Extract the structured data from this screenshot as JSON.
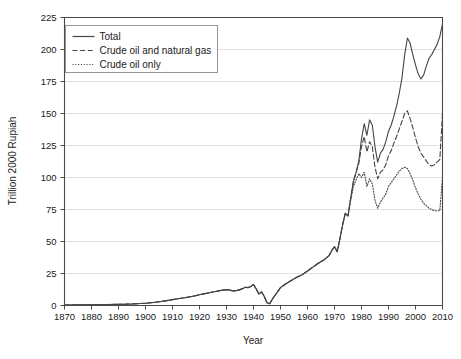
{
  "chart_data": {
    "type": "line",
    "title": "",
    "xlabel": "Year",
    "ylabel": "Trillion 2000 Rupiah",
    "xlim": [
      1870,
      2010
    ],
    "ylim": [
      0,
      225
    ],
    "xticks": [
      1870,
      1880,
      1890,
      1900,
      1910,
      1920,
      1930,
      1940,
      1950,
      1960,
      1970,
      1980,
      1990,
      2000,
      2010
    ],
    "yticks": [
      0,
      25,
      50,
      75,
      100,
      125,
      150,
      175,
      200,
      225
    ],
    "grid": "horizontal",
    "legend_position": "top-left",
    "series": [
      {
        "name": "Total",
        "style": "solid",
        "color": "#444444",
        "x": [
          1870,
          1875,
          1880,
          1885,
          1890,
          1895,
          1900,
          1903,
          1906,
          1909,
          1912,
          1915,
          1918,
          1920,
          1922,
          1924,
          1926,
          1928,
          1930,
          1931,
          1932,
          1933,
          1934,
          1935,
          1936,
          1937,
          1938,
          1939,
          1940,
          1941,
          1942,
          1943,
          1944,
          1945,
          1946,
          1947,
          1948,
          1949,
          1950,
          1952,
          1954,
          1956,
          1958,
          1960,
          1962,
          1964,
          1966,
          1968,
          1969,
          1970,
          1971,
          1972,
          1973,
          1974,
          1975,
          1976,
          1977,
          1978,
          1979,
          1980,
          1981,
          1982,
          1983,
          1984,
          1985,
          1986,
          1987,
          1988,
          1989,
          1990,
          1991,
          1992,
          1993,
          1994,
          1995,
          1996,
          1997,
          1998,
          1999,
          2000,
          2001,
          2002,
          2003,
          2004,
          2005,
          2006,
          2007,
          2008,
          2009,
          2010
        ],
        "y": [
          0.4,
          0.5,
          0.6,
          0.7,
          0.9,
          1.2,
          1.8,
          2.4,
          3.2,
          4.2,
          5.3,
          6.2,
          7.4,
          8.4,
          9.3,
          10.2,
          11.0,
          11.8,
          12.4,
          12.2,
          11.6,
          11.4,
          11.8,
          12.4,
          13.2,
          14.2,
          14.0,
          14.8,
          16.4,
          13.0,
          9.0,
          10.6,
          7.0,
          2.2,
          1.4,
          5.0,
          8.0,
          11.0,
          14.0,
          17.0,
          19.5,
          22.0,
          24.0,
          27.0,
          30.0,
          33.0,
          35.5,
          39.0,
          43.0,
          46.0,
          42.0,
          52.0,
          63.0,
          72.0,
          70.0,
          84.0,
          97.0,
          104.0,
          113.0,
          130.0,
          142.0,
          133.0,
          145.0,
          141.0,
          124.0,
          112.0,
          119.0,
          122.0,
          128.0,
          136.0,
          141.0,
          148.0,
          156.0,
          166.0,
          178.0,
          196.0,
          209.0,
          205.0,
          196.0,
          188.0,
          181.0,
          177.0,
          180.0,
          187.0,
          193.0,
          196.0,
          200.0,
          204.0,
          210.0,
          220.0
        ]
      },
      {
        "name": "Crude oil and natural gas",
        "style": "dashed",
        "color": "#444444",
        "x": [
          1870,
          1875,
          1880,
          1885,
          1890,
          1895,
          1900,
          1903,
          1906,
          1909,
          1912,
          1915,
          1918,
          1920,
          1922,
          1924,
          1926,
          1928,
          1930,
          1931,
          1932,
          1933,
          1934,
          1935,
          1936,
          1937,
          1938,
          1939,
          1940,
          1941,
          1942,
          1943,
          1944,
          1945,
          1946,
          1947,
          1948,
          1949,
          1950,
          1952,
          1954,
          1956,
          1958,
          1960,
          1962,
          1964,
          1966,
          1968,
          1969,
          1970,
          1971,
          1972,
          1973,
          1974,
          1975,
          1976,
          1977,
          1978,
          1979,
          1980,
          1981,
          1982,
          1983,
          1984,
          1985,
          1986,
          1987,
          1988,
          1989,
          1990,
          1991,
          1992,
          1993,
          1994,
          1995,
          1996,
          1997,
          1998,
          1999,
          2000,
          2001,
          2002,
          2003,
          2004,
          2005,
          2006,
          2007,
          2008,
          2009,
          2010
        ],
        "y": [
          0.4,
          0.5,
          0.6,
          0.7,
          0.9,
          1.2,
          1.8,
          2.4,
          3.2,
          4.2,
          5.3,
          6.2,
          7.4,
          8.4,
          9.3,
          10.2,
          11.0,
          11.8,
          12.4,
          12.2,
          11.6,
          11.4,
          11.8,
          12.4,
          13.2,
          14.2,
          14.0,
          14.8,
          16.4,
          13.0,
          9.0,
          10.6,
          7.0,
          2.2,
          1.4,
          5.0,
          8.0,
          11.0,
          14.0,
          17.0,
          19.5,
          22.0,
          24.0,
          27.0,
          30.0,
          33.0,
          35.5,
          39.0,
          43.0,
          46.0,
          42.0,
          52.0,
          63.0,
          72.0,
          70.0,
          84.0,
          97.0,
          104.0,
          111.0,
          124.0,
          132.0,
          120.0,
          128.0,
          124.0,
          108.0,
          99.0,
          104.0,
          106.0,
          110.0,
          117.0,
          121.0,
          127.0,
          132.0,
          138.0,
          144.0,
          150.0,
          152.0,
          146.0,
          139.0,
          131.0,
          124.0,
          119.0,
          116.0,
          113.0,
          110.0,
          109.0,
          110.0,
          112.0,
          114.0,
          150.0
        ]
      },
      {
        "name": "Crude oil only",
        "style": "dotted",
        "color": "#444444",
        "x": [
          1870,
          1875,
          1880,
          1885,
          1890,
          1895,
          1900,
          1903,
          1906,
          1909,
          1912,
          1915,
          1918,
          1920,
          1922,
          1924,
          1926,
          1928,
          1930,
          1931,
          1932,
          1933,
          1934,
          1935,
          1936,
          1937,
          1938,
          1939,
          1940,
          1941,
          1942,
          1943,
          1944,
          1945,
          1946,
          1947,
          1948,
          1949,
          1950,
          1952,
          1954,
          1956,
          1958,
          1960,
          1962,
          1964,
          1966,
          1968,
          1969,
          1970,
          1971,
          1972,
          1973,
          1974,
          1975,
          1976,
          1977,
          1978,
          1979,
          1980,
          1981,
          1982,
          1983,
          1984,
          1985,
          1986,
          1987,
          1988,
          1989,
          1990,
          1991,
          1992,
          1993,
          1994,
          1995,
          1996,
          1997,
          1998,
          1999,
          2000,
          2001,
          2002,
          2003,
          2004,
          2005,
          2006,
          2007,
          2008,
          2009,
          2010
        ],
        "y": [
          0.4,
          0.5,
          0.6,
          0.7,
          0.9,
          1.2,
          1.8,
          2.4,
          3.2,
          4.2,
          5.3,
          6.2,
          7.4,
          8.4,
          9.3,
          10.2,
          11.0,
          11.8,
          12.4,
          12.2,
          11.6,
          11.4,
          11.8,
          12.4,
          13.2,
          14.2,
          14.0,
          14.8,
          16.4,
          13.0,
          9.0,
          10.6,
          7.0,
          2.2,
          1.4,
          5.0,
          8.0,
          11.0,
          14.0,
          17.0,
          19.5,
          22.0,
          24.0,
          27.0,
          30.0,
          33.0,
          35.5,
          39.0,
          43.0,
          46.0,
          42.0,
          52.0,
          63.0,
          72.0,
          70.0,
          82.0,
          93.0,
          98.0,
          103.0,
          100.0,
          104.0,
          93.0,
          99.0,
          95.0,
          82.0,
          76.0,
          81.0,
          84.0,
          87.0,
          93.0,
          96.0,
          99.0,
          102.0,
          105.0,
          107.0,
          108.0,
          107.0,
          103.0,
          98.0,
          92.0,
          87.0,
          83.0,
          80.0,
          78.0,
          76.0,
          75.0,
          74.0,
          74.0,
          74.0,
          100.0
        ]
      }
    ]
  },
  "legend": {
    "entries": [
      {
        "label": "Total",
        "style": "solid"
      },
      {
        "label": "Crude oil and natural gas",
        "style": "dashed"
      },
      {
        "label": "Crude oil only",
        "style": "dotted"
      }
    ]
  },
  "axes": {
    "y_title": "Trillion 2000 Rupiah",
    "x_title": "Year",
    "y_tick_labels": [
      "0",
      "25",
      "50",
      "75",
      "100",
      "125",
      "150",
      "175",
      "200",
      "225"
    ],
    "x_tick_labels": [
      "1870",
      "1880",
      "1890",
      "1900",
      "1910",
      "1920",
      "1930",
      "1940",
      "1950",
      "1960",
      "1970",
      "1980",
      "1990",
      "2000",
      "2010"
    ]
  },
  "colors": {
    "line": "#444444",
    "grid": "#d8d8d8",
    "axis": "#4a4a4a",
    "legend_border": "#8a8a8a",
    "background": "#ffffff"
  }
}
